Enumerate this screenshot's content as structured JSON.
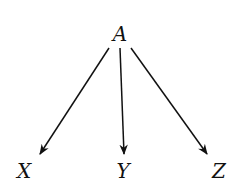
{
  "nodes": [
    {
      "id": "A",
      "label": "A",
      "x": 120,
      "y": 34
    },
    {
      "id": "X",
      "label": "X",
      "x": 24,
      "y": 171
    },
    {
      "id": "Y",
      "label": "Y",
      "x": 123,
      "y": 171
    },
    {
      "id": "Z",
      "label": "Z",
      "x": 219,
      "y": 171
    }
  ],
  "edges": [
    {
      "from": "A",
      "to": "X"
    },
    {
      "from": "A",
      "to": "Y"
    },
    {
      "from": "A",
      "to": "Z"
    }
  ],
  "colors": {
    "stroke": "#111111",
    "background": "#ffffff"
  }
}
